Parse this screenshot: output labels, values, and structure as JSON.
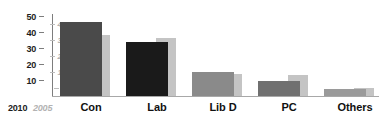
{
  "chart_data": {
    "type": "bar",
    "title": "",
    "subtitle": "",
    "xlabel": "",
    "ylabel": "",
    "grid": false,
    "legend_position": "axis-left",
    "categories": [
      "Con",
      "Lab",
      "Lib D",
      "PC",
      "Others"
    ],
    "series": [
      {
        "name": "2010",
        "axis": "left",
        "values": [
          43,
          31.5,
          14,
          9,
          4
        ]
      },
      {
        "name": "2005",
        "axis": "right",
        "values": [
          35.5,
          34,
          13,
          12.5,
          4.5
        ]
      }
    ],
    "axes": {
      "left": {
        "name": "2010",
        "ticks": [
          "50",
          "40",
          "30",
          "20",
          "10"
        ],
        "tick_values": [
          50,
          40,
          30,
          20,
          10
        ],
        "ylim": [
          0,
          50
        ],
        "color": "#1c1c1c"
      },
      "right": {
        "name": "2005",
        "ticks": [
          "45",
          "35",
          "25",
          "15",
          "5"
        ],
        "tick_values": [
          45,
          35,
          25,
          15,
          5
        ],
        "ylim": [
          0,
          50
        ],
        "color": "#aeaeae"
      }
    },
    "bar_colors_2010": [
      "#4a4a4a",
      "#1a1a1a",
      "#8a8a8a",
      "#707070",
      "#9a9a9a"
    ],
    "bar_color_2005": "#c4c4c4",
    "colors": {
      "background": "#ffffff",
      "axis_line": "#7d7d7d",
      "baseline": "#a8a8a8",
      "label_text": "#111111"
    }
  }
}
